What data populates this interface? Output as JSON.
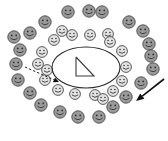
{
  "diagram": {
    "background_color": "#ffffff",
    "canvas": {
      "width": 168,
      "height": 141
    },
    "center": {
      "x": 86,
      "y": 67
    }
  },
  "center_shape": {
    "name": "ellipse",
    "cx": 86,
    "cy": 67.5,
    "rx": 34,
    "ry": 20.5,
    "stroke_color": "#2b2b2b",
    "fill": "none"
  },
  "inner_figure": {
    "name": "right-triangle",
    "stroke_color": "#3a3a3a",
    "fill": "none",
    "points": [
      {
        "x": 76,
        "y": 57
      },
      {
        "x": 76,
        "y": 76
      },
      {
        "x": 94,
        "y": 76
      }
    ]
  },
  "rings": [
    {
      "name": "outer-ring",
      "face_fill": "#9a9a9a",
      "face_stroke": "#4a4a4a",
      "count": 22,
      "radius": {
        "rx": 74,
        "ry": 60
      },
      "face_radius": 6.2
    },
    {
      "name": "inner-ring",
      "face_fill": "#e2e2e2",
      "face_stroke": "#4a4a4a",
      "count": 18,
      "radius": {
        "rx": 47,
        "ry": 36
      },
      "face_radius": 5.4
    }
  ],
  "faces": {
    "outer": [
      {
        "x": 68,
        "y": 12
      },
      {
        "x": 89,
        "y": 11
      },
      {
        "x": 102,
        "y": 12
      },
      {
        "x": 45,
        "y": 22
      },
      {
        "x": 129,
        "y": 22
      },
      {
        "x": 30,
        "y": 33
      },
      {
        "x": 143,
        "y": 31
      },
      {
        "x": 20,
        "y": 50
      },
      {
        "x": 149,
        "y": 44
      },
      {
        "x": 16,
        "y": 64
      },
      {
        "x": 153,
        "y": 69
      },
      {
        "x": 18,
        "y": 80
      },
      {
        "x": 141,
        "y": 83
      },
      {
        "x": 30,
        "y": 93
      },
      {
        "x": 126,
        "y": 97
      },
      {
        "x": 41,
        "y": 105
      },
      {
        "x": 60,
        "y": 112
      },
      {
        "x": 78,
        "y": 117
      },
      {
        "x": 99,
        "y": 117
      },
      {
        "x": 14,
        "y": 37
      },
      {
        "x": 113,
        "y": 107
      },
      {
        "x": 151,
        "y": 56
      }
    ],
    "inner": [
      {
        "x": 72,
        "y": 35
      },
      {
        "x": 90,
        "y": 35
      },
      {
        "x": 108,
        "y": 34
      },
      {
        "x": 54,
        "y": 40
      },
      {
        "x": 122,
        "y": 51
      },
      {
        "x": 42,
        "y": 52
      },
      {
        "x": 126,
        "y": 67
      },
      {
        "x": 38,
        "y": 64
      },
      {
        "x": 122,
        "y": 81
      },
      {
        "x": 45,
        "y": 80
      },
      {
        "x": 58,
        "y": 90
      },
      {
        "x": 113,
        "y": 91
      },
      {
        "x": 75,
        "y": 94
      },
      {
        "x": 95,
        "y": 95
      },
      {
        "x": 47,
        "y": 70
      },
      {
        "x": 110,
        "y": 42
      },
      {
        "x": 62,
        "y": 31
      },
      {
        "x": 103,
        "y": 99
      }
    ]
  },
  "annotations": {
    "dashed_arrow": {
      "name": "dashed-pointer-arrow",
      "style": "dashed",
      "color": "#222222",
      "from": {
        "x": 25,
        "y": 67
      },
      "to": {
        "x": 59,
        "y": 82
      },
      "direction": "down-right",
      "points_to": "ellipse-left-edge"
    },
    "solid_arrow": {
      "name": "solid-pointer-arrow",
      "style": "solid",
      "color": "#111111",
      "from": {
        "x": 164,
        "y": 79
      },
      "to": {
        "x": 136,
        "y": 101
      },
      "direction": "down-left",
      "points_to": "outer-ring-lower-right"
    }
  },
  "face_expression": {
    "eyes": "two-dots",
    "mouth": "smile-arc"
  }
}
